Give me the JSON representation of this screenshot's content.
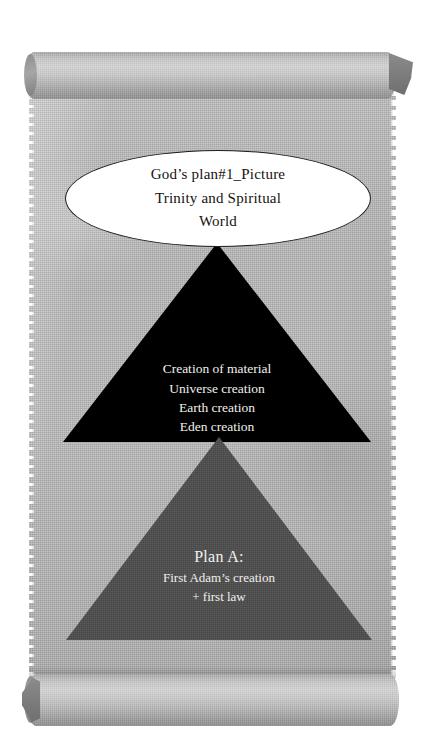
{
  "diagram": {
    "medium": "parchment-scroll",
    "title_node": {
      "shape": "ellipse",
      "fill_color": "#ffffff",
      "border_color": "#1c1c1c",
      "text_color": "#15120f",
      "lines": [
        "God’s plan#1_Picture",
        "Trinity and Spiritual",
        "World"
      ]
    },
    "levels": [
      {
        "id": "creation",
        "shape": "triangle",
        "fill_color": "#000000",
        "text_color": "#f2f0ec",
        "lines": [
          "Creation of material",
          "Universe creation",
          "Earth creation",
          "Eden creation"
        ]
      },
      {
        "id": "plan-a",
        "shape": "triangle",
        "fill_color": "#4e4e4e",
        "text_color": "#f2f0ec",
        "heading": "Plan A:",
        "lines": [
          "First Adam’s creation",
          "+  first law"
        ]
      }
    ],
    "scroll": {
      "sheet_color": "#b4b4b4",
      "roll_color": "#c9c9c9",
      "top_roll_label": "top-scroll-roll",
      "bottom_roll_label": "bottom-scroll-roll"
    }
  }
}
